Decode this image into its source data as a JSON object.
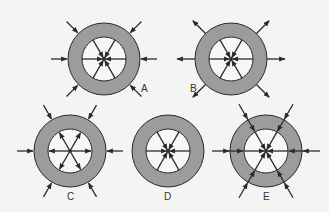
{
  "diagram": {
    "background": "#f4f4f3",
    "colors": {
      "ring_fill": "#9c9c9c",
      "inner_fill": "#f7f7f6",
      "stroke": "#2a2a2a"
    },
    "outer_radius": 36,
    "inner_radius": 22,
    "panels": [
      {
        "id": "A",
        "label": "A",
        "cx": 104,
        "cy": 59,
        "label_x": 141,
        "label_y": 92,
        "inner_arrows": "inward",
        "outer_arrows": "inward",
        "through_lines": false,
        "outer_angles": [
          0,
          45,
          135,
          180,
          225,
          315
        ]
      },
      {
        "id": "B",
        "label": "B",
        "cx": 231,
        "cy": 59,
        "label_x": 190,
        "label_y": 92,
        "inner_arrows": "inward",
        "outer_arrows": "outward",
        "through_lines": false,
        "outer_angles": [
          0,
          45,
          135,
          180,
          225,
          315
        ]
      },
      {
        "id": "C",
        "label": "C",
        "cx": 70,
        "cy": 151,
        "label_x": 67,
        "label_y": 200,
        "inner_arrows": "outward",
        "outer_arrows": "inward",
        "through_lines": false,
        "outer_angles": [
          0,
          60,
          120,
          180,
          240,
          300
        ]
      },
      {
        "id": "D",
        "label": "D",
        "cx": 168,
        "cy": 151,
        "label_x": 164,
        "label_y": 200,
        "inner_arrows": "inward",
        "outer_arrows": "none",
        "through_lines": false,
        "outer_angles": []
      },
      {
        "id": "E",
        "label": "E",
        "cx": 266,
        "cy": 151,
        "label_x": 263,
        "label_y": 200,
        "inner_arrows": "inward",
        "outer_arrows": "inward",
        "through_lines": true,
        "outer_angles": [
          0,
          60,
          120,
          180,
          240,
          300
        ]
      }
    ]
  }
}
